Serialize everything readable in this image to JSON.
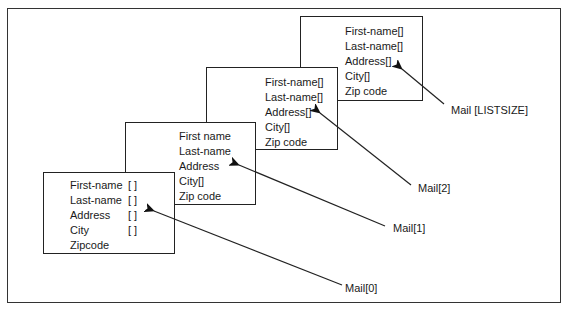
{
  "diagram": {
    "records": [
      {
        "id": "mail-0",
        "fields": [
          {
            "name": "First-name",
            "suffix": "[ ]"
          },
          {
            "name": "Last-name",
            "suffix": "[ ]"
          },
          {
            "name": "Address",
            "suffix": "[ ]"
          },
          {
            "name": "City",
            "suffix": "[ ]"
          },
          {
            "name": "Zipcode",
            "suffix": ""
          }
        ],
        "label": "Mail[0]"
      },
      {
        "id": "mail-1",
        "fields": [
          {
            "name": "First name"
          },
          {
            "name": "Last-name"
          },
          {
            "name": "Address"
          },
          {
            "name": "City[]"
          },
          {
            "name": "Zip code"
          }
        ],
        "label": "Mail[1]"
      },
      {
        "id": "mail-2",
        "fields": [
          {
            "name": "First-name[]"
          },
          {
            "name": "Last-name[]"
          },
          {
            "name": "Address[]"
          },
          {
            "name": "City[]"
          },
          {
            "name": "Zip code"
          }
        ],
        "label": "Mail[2]"
      },
      {
        "id": "mail-listsize",
        "fields": [
          {
            "name": "First-name[]"
          },
          {
            "name": "Last-name[]"
          },
          {
            "name": "Address[]"
          },
          {
            "name": "City[]"
          },
          {
            "name": "Zip code"
          }
        ],
        "label": "Mail [LISTSIZE]"
      }
    ],
    "colors": {
      "line": "#222222",
      "background": "#ffffff"
    }
  }
}
